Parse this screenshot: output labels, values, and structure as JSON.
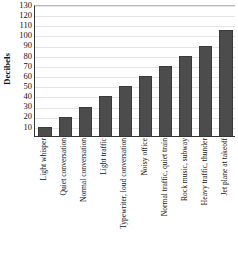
{
  "chart_data": {
    "type": "bar",
    "title": "",
    "subtitle": "",
    "xlabel": "",
    "ylabel": "Decibels",
    "ylim": [
      0,
      130
    ],
    "ytick_step": 10,
    "grid": true,
    "legend": "none",
    "bar_color": "#4c4c4c",
    "bar_edge_color": "#3a3a3a",
    "gridline_color": "#e4e4e4",
    "axis_color": "#333333",
    "yticks": [
      130,
      120,
      110,
      100,
      90,
      80,
      70,
      60,
      50,
      40,
      30,
      20,
      10
    ],
    "categories": [
      "Light whisper",
      "Quiet conversation",
      "Normal conversation",
      "Light traffic",
      "Typewriter, loud conversation",
      "Noisy office",
      "Normal traffic, quiet train",
      "Rock music, subway",
      "Heavy traffic, thunder",
      "Jet plane at takeoff"
    ],
    "values": [
      10,
      20,
      30,
      40,
      50,
      60,
      70,
      80,
      90,
      105
    ]
  }
}
